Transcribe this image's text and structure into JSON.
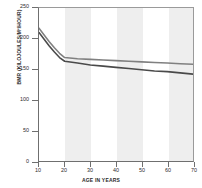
{
  "chart_data": {
    "type": "line",
    "title": "",
    "xlabel": "AGE IN YEARS",
    "ylabel": "BMR (KILOJOULES/M²/HOUR)",
    "xlim": [
      10,
      70
    ],
    "ylim": [
      0,
      250
    ],
    "xticks": [
      10,
      20,
      30,
      40,
      50,
      60,
      70
    ],
    "yticks": [
      0,
      50,
      100,
      150,
      200,
      250
    ],
    "grid": false,
    "legend": "none",
    "banding": {
      "note": "alternating vertical shaded columns, shaded on 20-30, 40-50, 60-70",
      "shaded_ranges": [
        [
          20,
          30
        ],
        [
          40,
          50
        ],
        [
          60,
          70
        ]
      ],
      "shade_color": "#eeeeee"
    },
    "x": [
      10,
      12,
      14,
      16,
      18,
      20,
      25,
      30,
      35,
      40,
      45,
      50,
      55,
      60,
      65,
      70
    ],
    "series": [
      {
        "name": "upper-curve",
        "color": "#808080",
        "values": [
          217,
          206,
          195,
          185,
          176,
          169,
          167,
          166,
          165,
          164,
          163,
          162,
          161,
          160,
          159,
          158
        ]
      },
      {
        "name": "lower-curve",
        "color": "#4a4a4a",
        "values": [
          210,
          199,
          188,
          178,
          169,
          163,
          160,
          157,
          155,
          153,
          151,
          149,
          147,
          146,
          144,
          142
        ]
      }
    ]
  },
  "axis": {
    "x_tick_labels": [
      "10",
      "20",
      "30",
      "40",
      "50",
      "60",
      "70"
    ],
    "y_tick_labels": [
      "0",
      "50",
      "100",
      "150",
      "200",
      "250"
    ]
  }
}
